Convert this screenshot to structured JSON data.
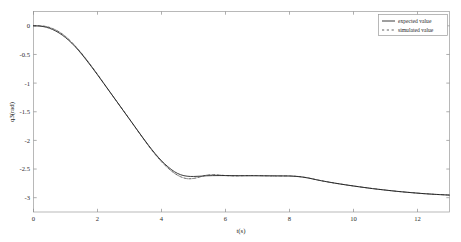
{
  "chart_data": {
    "type": "line",
    "title": "",
    "xlabel": "t(s)",
    "ylabel": "q3(rad)",
    "xlim": [
      0,
      13
    ],
    "ylim": [
      -3.25,
      0.25
    ],
    "xticks": [
      "0",
      "2",
      "4",
      "6",
      "8",
      "10",
      "12"
    ],
    "xtick_values": [
      0,
      2,
      4,
      6,
      8,
      10,
      12
    ],
    "yticks": [
      "0",
      "-0.5",
      "-1",
      "-1.5",
      "-2",
      "-2.5",
      "-3"
    ],
    "ytick_values": [
      0,
      -0.5,
      -1,
      -1.5,
      -2,
      -2.5,
      -3
    ],
    "grid": false,
    "legend_position": "top-right",
    "box": true,
    "series": [
      {
        "name": "expected value",
        "style": "solid",
        "color": "#1a1a1a",
        "x": [
          0,
          0.2,
          0.4,
          0.6,
          0.8,
          1.0,
          1.2,
          1.4,
          1.6,
          1.8,
          2.0,
          2.2,
          2.4,
          2.6,
          2.8,
          3.0,
          3.2,
          3.4,
          3.6,
          3.8,
          4.0,
          4.2,
          4.4,
          4.6,
          4.8,
          5.0,
          5.2,
          5.4,
          5.6,
          5.8,
          6.0,
          6.2,
          6.4,
          6.6,
          6.8,
          7.0,
          7.2,
          7.4,
          7.6,
          7.8,
          8.0,
          8.2,
          8.4,
          8.6,
          8.8,
          9.0,
          9.4,
          9.8,
          10.2,
          10.6,
          11.0,
          11.4,
          11.8,
          12.2,
          12.6,
          13.0
        ],
        "y": [
          0.0,
          -0.005,
          -0.025,
          -0.065,
          -0.125,
          -0.205,
          -0.305,
          -0.425,
          -0.56,
          -0.705,
          -0.855,
          -1.01,
          -1.165,
          -1.32,
          -1.475,
          -1.63,
          -1.785,
          -1.94,
          -2.09,
          -2.23,
          -2.355,
          -2.46,
          -2.545,
          -2.6,
          -2.625,
          -2.63,
          -2.625,
          -2.618,
          -2.615,
          -2.614,
          -2.614,
          -2.615,
          -2.616,
          -2.617,
          -2.618,
          -2.618,
          -2.618,
          -2.618,
          -2.619,
          -2.62,
          -2.622,
          -2.628,
          -2.64,
          -2.658,
          -2.682,
          -2.705,
          -2.745,
          -2.78,
          -2.812,
          -2.842,
          -2.868,
          -2.892,
          -2.912,
          -2.93,
          -2.944,
          -2.955
        ]
      },
      {
        "name": "simulated value",
        "style": "dash-dot",
        "color": "#2e2e2e",
        "x": [
          0,
          0.2,
          0.4,
          0.6,
          0.8,
          1.0,
          1.2,
          1.4,
          1.6,
          1.8,
          2.0,
          2.2,
          2.4,
          2.6,
          2.8,
          3.0,
          3.2,
          3.4,
          3.6,
          3.8,
          4.0,
          4.2,
          4.4,
          4.6,
          4.8,
          5.0,
          5.2,
          5.4,
          5.6,
          5.8,
          6.0,
          6.2,
          6.4,
          6.6,
          6.8,
          7.0,
          7.2,
          7.4,
          7.6,
          7.8,
          8.0,
          8.2,
          8.4,
          8.6,
          8.8,
          9.0,
          9.4,
          9.8,
          10.2,
          10.6,
          11.0,
          11.4,
          11.8,
          12.2,
          12.6,
          13.0
        ],
        "y": [
          0.0,
          0.0,
          -0.012,
          -0.048,
          -0.105,
          -0.185,
          -0.29,
          -0.412,
          -0.548,
          -0.695,
          -0.848,
          -1.005,
          -1.162,
          -1.318,
          -1.474,
          -1.63,
          -1.788,
          -1.945,
          -2.098,
          -2.242,
          -2.372,
          -2.482,
          -2.572,
          -2.635,
          -2.668,
          -2.664,
          -2.638,
          -2.608,
          -2.598,
          -2.604,
          -2.614,
          -2.62,
          -2.62,
          -2.616,
          -2.613,
          -2.614,
          -2.618,
          -2.621,
          -2.622,
          -2.621,
          -2.62,
          -2.626,
          -2.638,
          -2.657,
          -2.681,
          -2.704,
          -2.744,
          -2.779,
          -2.811,
          -2.841,
          -2.867,
          -2.891,
          -2.911,
          -2.929,
          -2.943,
          -2.954
        ]
      }
    ]
  },
  "legend": {
    "items": [
      {
        "label": "expected value",
        "style": "solid"
      },
      {
        "label": "simulated value",
        "style": "dash-dot"
      }
    ]
  },
  "axes": {
    "x_title": "t(s)",
    "y_title": "q3(rad)"
  }
}
